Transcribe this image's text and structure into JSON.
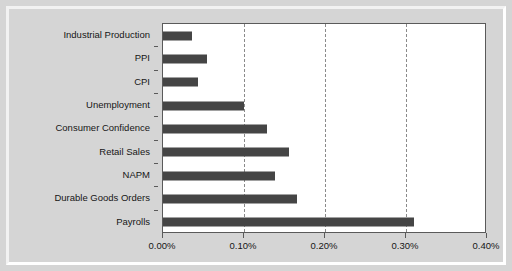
{
  "chart_data": {
    "type": "bar",
    "orientation": "horizontal",
    "title": "",
    "xlabel": "",
    "ylabel": "",
    "xlim": [
      0,
      0.4
    ],
    "grid": true,
    "legend": false,
    "xticks": [
      "0.00%",
      "0.10%",
      "0.20%",
      "0.30%",
      "0.40%"
    ],
    "xtick_values": [
      0.0,
      0.1,
      0.2,
      0.3,
      0.4
    ],
    "categories": [
      "Industrial Production",
      "PPI",
      "CPI",
      "Unemployment",
      "Consumer Confidence",
      "Retail Sales",
      "NAPM",
      "Durable Goods Orders",
      "Payrolls"
    ],
    "values": [
      0.036,
      0.054,
      0.043,
      0.1,
      0.128,
      0.156,
      0.138,
      0.166,
      0.31
    ],
    "value_labels": [
      "0.036%",
      "0.054%",
      "0.043%",
      "0.100%",
      "0.128%",
      "0.156%",
      "0.138%",
      "0.166%",
      "0.310%"
    ]
  },
  "style": {
    "bar_color": "#454545",
    "plot_background": "#ffffff",
    "figure_background": "#d5d5d5",
    "axis_color": "#5a5a5a",
    "gridline_color": "#8a8a8a",
    "text_color": "#161616"
  }
}
